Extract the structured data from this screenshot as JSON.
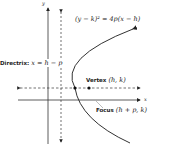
{
  "labels": {
    "equation": "(y − k)² = 4p(x − h)",
    "directrix_label": "Directrix:",
    "directrix_eq": "x = h − p",
    "vertex_label": "Vertex",
    "vertex_coords": "(h, k)",
    "focus_label": "Focus",
    "focus_coords": "(h + p, k)",
    "x_axis": "x",
    "y_axis": "y"
  }
}
